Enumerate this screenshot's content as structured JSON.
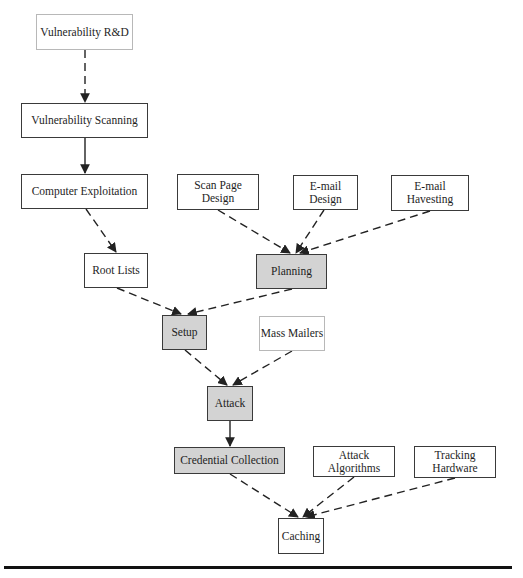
{
  "diagram": {
    "type": "flowchart",
    "colors": {
      "shaded_fill": "#d3d3d3",
      "border": "#3a3a3a",
      "faint_border": "#b8b8b8",
      "edge": "#222222"
    },
    "nodes": [
      {
        "id": "vuln_rd",
        "label": "Vulnerability R&D",
        "style": "faint"
      },
      {
        "id": "vuln_scan",
        "label": "Vulnerability Scanning",
        "style": "normal"
      },
      {
        "id": "comp_exploit",
        "label": "Computer Exploitation",
        "style": "normal"
      },
      {
        "id": "scan_page",
        "label": "Scan Page Design",
        "style": "normal"
      },
      {
        "id": "email_design",
        "label": "E-mail Design",
        "style": "normal"
      },
      {
        "id": "email_harvest",
        "label": "E-mail Havesting",
        "style": "normal"
      },
      {
        "id": "root_lists",
        "label": "Root Lists",
        "style": "normal"
      },
      {
        "id": "planning",
        "label": "Planning",
        "style": "shaded"
      },
      {
        "id": "setup",
        "label": "Setup",
        "style": "shaded"
      },
      {
        "id": "mass_mailers",
        "label": "Mass Mailers",
        "style": "faint"
      },
      {
        "id": "attack",
        "label": "Attack",
        "style": "shaded"
      },
      {
        "id": "cred_collection",
        "label": "Credential Collection",
        "style": "shaded"
      },
      {
        "id": "attack_algos",
        "label": "Attack Algorithms",
        "style": "normal"
      },
      {
        "id": "tracking_hw",
        "label": "Tracking Hardware",
        "style": "normal"
      },
      {
        "id": "caching",
        "label": "Caching",
        "style": "normal"
      }
    ],
    "edges": [
      {
        "from": "vuln_rd",
        "to": "vuln_scan",
        "line": "dashed"
      },
      {
        "from": "vuln_scan",
        "to": "comp_exploit",
        "line": "solid"
      },
      {
        "from": "comp_exploit",
        "to": "root_lists",
        "line": "dashed"
      },
      {
        "from": "scan_page",
        "to": "planning",
        "line": "dashed"
      },
      {
        "from": "email_design",
        "to": "planning",
        "line": "dashed"
      },
      {
        "from": "email_harvest",
        "to": "planning",
        "line": "dashed"
      },
      {
        "from": "root_lists",
        "to": "setup",
        "line": "dashed"
      },
      {
        "from": "planning",
        "to": "setup",
        "line": "dashed"
      },
      {
        "from": "setup",
        "to": "attack",
        "line": "dashed"
      },
      {
        "from": "mass_mailers",
        "to": "attack",
        "line": "dashed"
      },
      {
        "from": "attack",
        "to": "cred_collection",
        "line": "solid"
      },
      {
        "from": "cred_collection",
        "to": "caching",
        "line": "dashed"
      },
      {
        "from": "attack_algos",
        "to": "caching",
        "line": "dashed"
      },
      {
        "from": "tracking_hw",
        "to": "caching",
        "line": "dashed"
      }
    ]
  },
  "labels": {
    "vuln_rd": "Vulnerability R&D",
    "vuln_scan": "Vulnerability Scanning",
    "comp_exploit": "Computer Exploitation",
    "scan_page": "Scan Page Design",
    "email_design": "E-mail Design",
    "email_harvest": "E-mail Havesting",
    "root_lists": "Root Lists",
    "planning": "Planning",
    "setup": "Setup",
    "mass_mailers": "Mass Mailers",
    "attack": "Attack",
    "cred_collection": "Credential Collection",
    "attack_algos_1": "Attack",
    "attack_algos_2": "Algorithms",
    "tracking_hw_1": "Tracking",
    "tracking_hw_2": "Hardware",
    "caching": "Caching"
  }
}
